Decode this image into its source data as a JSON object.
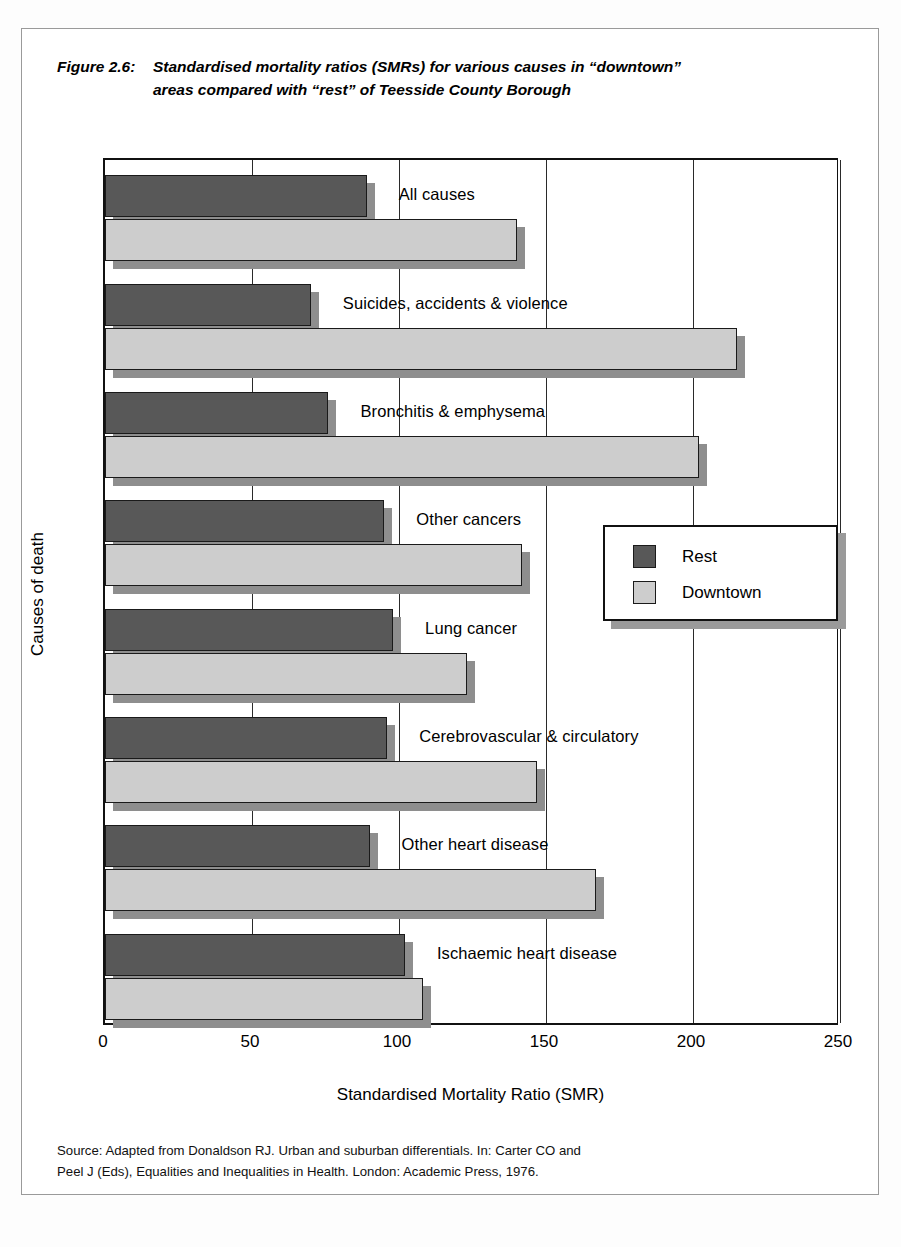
{
  "figure": {
    "number": "Figure 2.6:",
    "title_line1": "Standardised mortality ratios (SMRs) for various causes in “downtown”",
    "title_line2": "areas compared with “rest” of Teesside County Borough"
  },
  "source": {
    "line1": "Source: Adapted from Donaldson RJ. Urban and suburban differentials. In: Carter CO and",
    "line2": "Peel J (Eds), Equalities and Inequalities in Health. London: Academic Press, 1976."
  },
  "legend": {
    "items": [
      {
        "label": "Rest",
        "color": "#585858"
      },
      {
        "label": "Downtown",
        "color": "#cdcdcd"
      }
    ]
  },
  "chart_data": {
    "type": "bar",
    "orientation": "horizontal",
    "xlabel": "Standardised Mortality Ratio (SMR)",
    "ylabel": "Causes of death",
    "xlim": [
      0,
      250
    ],
    "xticks": [
      "0",
      "50",
      "100",
      "150",
      "200",
      "250"
    ],
    "xtick_values": [
      0,
      50,
      100,
      150,
      200,
      250
    ],
    "grid": "vertical",
    "legend_position": "right-middle",
    "categories": [
      "All causes",
      "Suicides, accidents & violence",
      "Bronchitis & emphysema",
      "Other cancers",
      "Lung cancer",
      "Cerebrovascular & circulatory",
      "Other heart disease",
      "Ischaemic heart disease"
    ],
    "series": [
      {
        "name": "Rest",
        "color": "#585858",
        "values": [
          89,
          70,
          76,
          95,
          98,
          96,
          90,
          102
        ]
      },
      {
        "name": "Downtown",
        "color": "#cdcdcd",
        "values": [
          140,
          215,
          202,
          142,
          123,
          147,
          167,
          108
        ]
      }
    ]
  }
}
